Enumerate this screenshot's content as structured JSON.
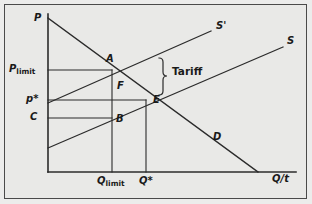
{
  "figure": {
    "type": "economics-diagram",
    "topic": "Tariff and limit pricing in international trade",
    "background_color": "#e9e9e7",
    "border_color": "#4a4a4a",
    "line_color": "#2b2b2b"
  },
  "axes": {
    "y_axis_label": "P",
    "x_axis_label": "Q/t",
    "origin_px": [
      48,
      172
    ],
    "x_axis_end_px": [
      296,
      172
    ],
    "y_axis_top_px": [
      48,
      14
    ]
  },
  "price_ticks": [
    {
      "id": "p-limit",
      "label_main": "P",
      "label_sub": "limit",
      "y_px": 70
    },
    {
      "id": "p-star",
      "label_main": "p",
      "label_sub": "*",
      "y_px": 100
    },
    {
      "id": "c",
      "label_main": "C",
      "label_sub": "",
      "y_px": 118
    }
  ],
  "quantity_ticks": [
    {
      "id": "q-limit",
      "label_main": "Q",
      "label_sub": "limit",
      "x_px": 112
    },
    {
      "id": "q-star",
      "label_main": "Q",
      "label_sub": "*",
      "x_px": 146
    }
  ],
  "curves": [
    {
      "id": "demand",
      "label": "D",
      "label_pos_px": [
        213,
        132
      ],
      "from_px": [
        48,
        18
      ],
      "to_px": [
        258,
        172
      ]
    },
    {
      "id": "supply-with-tariff",
      "label": "S'",
      "label_pos_px": [
        216,
        21
      ],
      "from_px": [
        48,
        103
      ],
      "to_px": [
        211,
        31
      ]
    },
    {
      "id": "supply",
      "label": "S",
      "label_pos_px": [
        287,
        36
      ],
      "from_px": [
        48,
        148
      ],
      "to_px": [
        283,
        47
      ]
    }
  ],
  "points": [
    {
      "id": "A",
      "label": "A",
      "at_px": [
        112,
        70
      ],
      "label_pos_px": [
        106,
        56
      ]
    },
    {
      "id": "F",
      "label": "F",
      "at_px": [
        122,
        86
      ],
      "label_pos_px": [
        117,
        82
      ]
    },
    {
      "id": "B",
      "label": "B",
      "at_px": [
        112,
        118
      ],
      "label_pos_px": [
        116,
        115
      ]
    },
    {
      "id": "E",
      "label": "E",
      "at_px": [
        146,
        100
      ],
      "label_pos_px": [
        153,
        96
      ]
    }
  ],
  "annotations": [
    {
      "id": "tariff-brace",
      "label": "Tariff",
      "label_pos_px": [
        176,
        69
      ],
      "brace_top_px": 58,
      "brace_bottom_px": 95,
      "brace_x_px": 162
    }
  ],
  "guide_lines": [
    {
      "id": "p-limit-line",
      "from_px": [
        48,
        70
      ],
      "to_px": [
        112,
        70
      ]
    },
    {
      "id": "p-star-line",
      "from_px": [
        48,
        100
      ],
      "to_px": [
        146,
        100
      ]
    },
    {
      "id": "c-line",
      "from_px": [
        48,
        118
      ],
      "to_px": [
        112,
        118
      ]
    },
    {
      "id": "q-limit-line",
      "from_px": [
        112,
        70
      ],
      "to_px": [
        112,
        172
      ]
    },
    {
      "id": "q-star-line",
      "from_px": [
        146,
        100
      ],
      "to_px": [
        146,
        172
      ]
    }
  ]
}
